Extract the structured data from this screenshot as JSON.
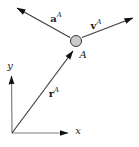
{
  "figure": {
    "background": "#ffffff",
    "point": {
      "label": "A",
      "fill": "#cccccc",
      "stroke": "#3a3a3a"
    },
    "labels": {
      "acceleration": {
        "base": "a",
        "sup": "A"
      },
      "velocity": {
        "base": "v",
        "sup": "A"
      },
      "position": {
        "base": "r",
        "sup": "A"
      },
      "x_axis": "x",
      "y_axis": "y"
    },
    "colors": {
      "vector_line": "#3f3f3f",
      "axis_line": "#7f7f7f",
      "arrowhead": "#111111",
      "text": "#1a1a1a"
    }
  }
}
